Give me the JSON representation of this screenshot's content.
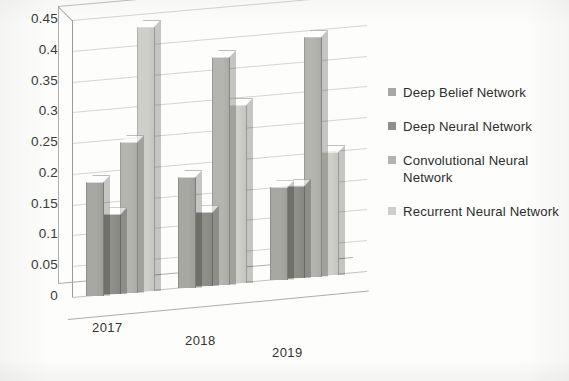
{
  "chart_data": {
    "type": "bar",
    "title": "",
    "subtitle": "",
    "xlabel": "",
    "ylabel": "",
    "categories": [
      "2017",
      "2018",
      "2019"
    ],
    "ylim": [
      0,
      0.45
    ],
    "yticks": [
      "0",
      "0.05",
      "0.1",
      "0.15",
      "0.2",
      "0.25",
      "0.3",
      "0.35",
      "0.4",
      "0.45"
    ],
    "ytick_values": [
      0,
      0.05,
      0.1,
      0.15,
      0.2,
      0.25,
      0.3,
      0.35,
      0.4,
      0.45
    ],
    "grid": true,
    "legend_position": "right",
    "three_d": true,
    "series": [
      {
        "name": "Deep Belief Network",
        "color": "#a8a8a3",
        "values": [
          0.185,
          0.18,
          0.15
        ]
      },
      {
        "name": "Deep Neural Network",
        "color": "#8f8f8a",
        "values": [
          0.13,
          0.12,
          0.15
        ]
      },
      {
        "name": "Convolutional Neural Network",
        "color": "#b5b5b0",
        "values": [
          0.245,
          0.37,
          0.39
        ]
      },
      {
        "name": "Recurrent Neural Network",
        "color": "#cfcfca",
        "values": [
          0.43,
          0.29,
          0.2
        ]
      }
    ]
  },
  "legend": {
    "entries": [
      {
        "label": "Deep Belief Network"
      },
      {
        "label": "Deep Neural Network"
      },
      {
        "label": "Convolutional Neural Network"
      },
      {
        "label": "Recurrent Neural Network"
      }
    ]
  },
  "axis": {
    "x_labels": [
      "2017",
      "2018",
      "2019"
    ],
    "y_labels": [
      "0.45",
      "0.4",
      "0.35",
      "0.3",
      "0.25",
      "0.2",
      "0.15",
      "0.1",
      "0.05",
      "0"
    ]
  }
}
